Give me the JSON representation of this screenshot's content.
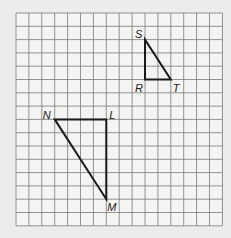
{
  "grid": {
    "cols": 16,
    "rows": 16,
    "origin_px": [
      16,
      13
    ],
    "cell_w": 12.9,
    "cell_h": 13.3,
    "line_color": "#7a7a7a",
    "background": "#f4f4f2"
  },
  "triangles": [
    {
      "name": "RST",
      "vertices": [
        {
          "label": "S",
          "col": 10,
          "row": 2,
          "label_dx": -10,
          "label_dy": -2
        },
        {
          "label": "R",
          "col": 10,
          "row": 5,
          "label_dx": -10,
          "label_dy": 12
        },
        {
          "label": "T",
          "col": 12,
          "row": 5,
          "label_dx": 2,
          "label_dy": 12
        }
      ]
    },
    {
      "name": "LMN",
      "vertices": [
        {
          "label": "N",
          "col": 3,
          "row": 8,
          "label_dx": -12,
          "label_dy": 0
        },
        {
          "label": "L",
          "col": 7,
          "row": 8,
          "label_dx": 3,
          "label_dy": 0
        },
        {
          "label": "M",
          "col": 7,
          "row": 14,
          "label_dx": 1,
          "label_dy": 12
        }
      ]
    }
  ],
  "stroke_color": "#1a1a1a"
}
